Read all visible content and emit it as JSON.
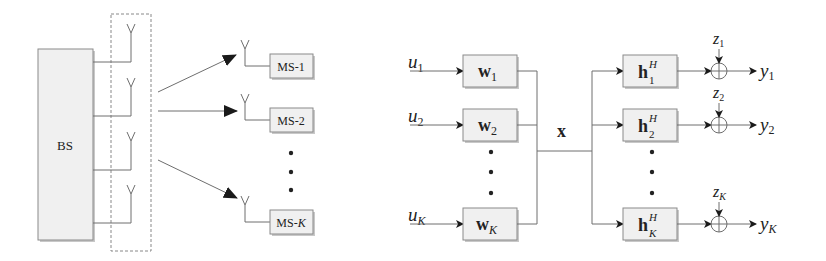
{
  "left_diagram": {
    "base_station": {
      "label": "BS"
    },
    "antenna_count": 4,
    "mobile_stations": [
      {
        "label_prefix": "MS-",
        "label_index": "1"
      },
      {
        "label_prefix": "MS-",
        "label_index": "2"
      },
      {
        "label_prefix": "MS-",
        "label_index": "K"
      }
    ],
    "ellipsis": "⋮"
  },
  "right_diagram": {
    "inputs": [
      {
        "sym": "u",
        "sub": "1"
      },
      {
        "sym": "u",
        "sub": "2"
      },
      {
        "sym": "u",
        "sub": "K"
      }
    ],
    "precoders": [
      {
        "sym": "w",
        "sub": "1"
      },
      {
        "sym": "w",
        "sub": "2"
      },
      {
        "sym": "w",
        "sub": "K"
      }
    ],
    "transmit_signal": "x",
    "channels": [
      {
        "sym": "h",
        "sub": "1",
        "sup": "H"
      },
      {
        "sym": "h",
        "sub": "2",
        "sup": "H"
      },
      {
        "sym": "h",
        "sub": "K",
        "sup": "H"
      }
    ],
    "noise": [
      {
        "sym": "z",
        "sub": "1"
      },
      {
        "sym": "z",
        "sub": "2"
      },
      {
        "sym": "z",
        "sub": "K"
      }
    ],
    "outputs": [
      {
        "sym": "y",
        "sub": "1"
      },
      {
        "sym": "y",
        "sub": "2"
      },
      {
        "sym": "y",
        "sub": "K"
      }
    ]
  }
}
